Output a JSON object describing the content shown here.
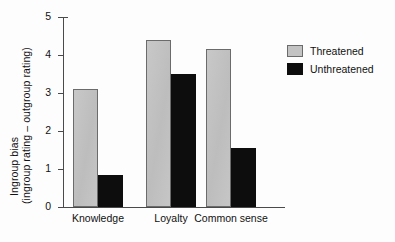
{
  "chart_data": {
    "type": "bar",
    "title": "",
    "xlabel": "",
    "ylabel_line1": "Ingroup bias",
    "ylabel_line2": "(ingroup rating – outgroup rating)",
    "categories": [
      "Knowledge",
      "Loyalty",
      "Common sense"
    ],
    "series": [
      {
        "name": "Threatened",
        "color": "#c3c3c3",
        "values": [
          3.1,
          4.4,
          4.15
        ]
      },
      {
        "name": "Unthreatened",
        "color": "#0d0d0d",
        "values": [
          0.85,
          3.5,
          1.55
        ]
      }
    ],
    "ylim": [
      0,
      5
    ],
    "yticks": [
      0,
      1,
      2,
      3,
      4,
      5
    ],
    "ytick_labels": [
      "0",
      "1",
      "2",
      "3",
      "4",
      "5"
    ],
    "grid": false,
    "legend_position": "right"
  }
}
